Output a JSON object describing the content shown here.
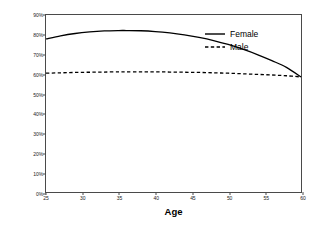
{
  "chart_data": {
    "type": "line",
    "title": "",
    "subtitle": "",
    "xlabel": "Age",
    "ylabel": "Adjusted Prevalence, Headache",
    "xlim": [
      25,
      60
    ],
    "ylim": [
      0,
      0.9
    ],
    "grid": false,
    "legend_position": "upper right",
    "xticks": [
      25,
      30,
      35,
      40,
      45,
      50,
      55,
      60
    ],
    "xticklabels": [
      "25",
      "30",
      "35",
      "40",
      "45",
      "50",
      "55",
      "60"
    ],
    "yticks": [
      0,
      0.1,
      0.2,
      0.3,
      0.4,
      0.5,
      0.6,
      0.7,
      0.8,
      0.9
    ],
    "yticklabels": [
      "0%",
      "10%",
      "20%",
      "30%",
      "40%",
      "50%",
      "60%",
      "70%",
      "80%",
      "90%"
    ],
    "x": [
      25,
      27,
      29,
      31,
      33,
      35,
      36,
      38,
      40,
      42,
      44,
      46,
      48,
      50,
      52,
      54,
      56,
      58,
      60
    ],
    "series": [
      {
        "name": "Female",
        "style": "solid",
        "color": "#000000",
        "values": [
          0.778,
          0.794,
          0.806,
          0.814,
          0.819,
          0.821,
          0.821,
          0.82,
          0.816,
          0.809,
          0.799,
          0.786,
          0.77,
          0.75,
          0.726,
          0.699,
          0.668,
          0.634,
          0.585
        ]
      },
      {
        "name": "Male",
        "style": "dashed",
        "color": "#000000",
        "values": [
          0.604,
          0.606,
          0.608,
          0.609,
          0.61,
          0.611,
          0.611,
          0.611,
          0.611,
          0.61,
          0.609,
          0.608,
          0.606,
          0.604,
          0.601,
          0.598,
          0.595,
          0.591,
          0.585
        ]
      }
    ]
  },
  "legend": {
    "entries": [
      {
        "label": "Female",
        "style": "solid"
      },
      {
        "label": "Male",
        "style": "dashed"
      }
    ]
  }
}
